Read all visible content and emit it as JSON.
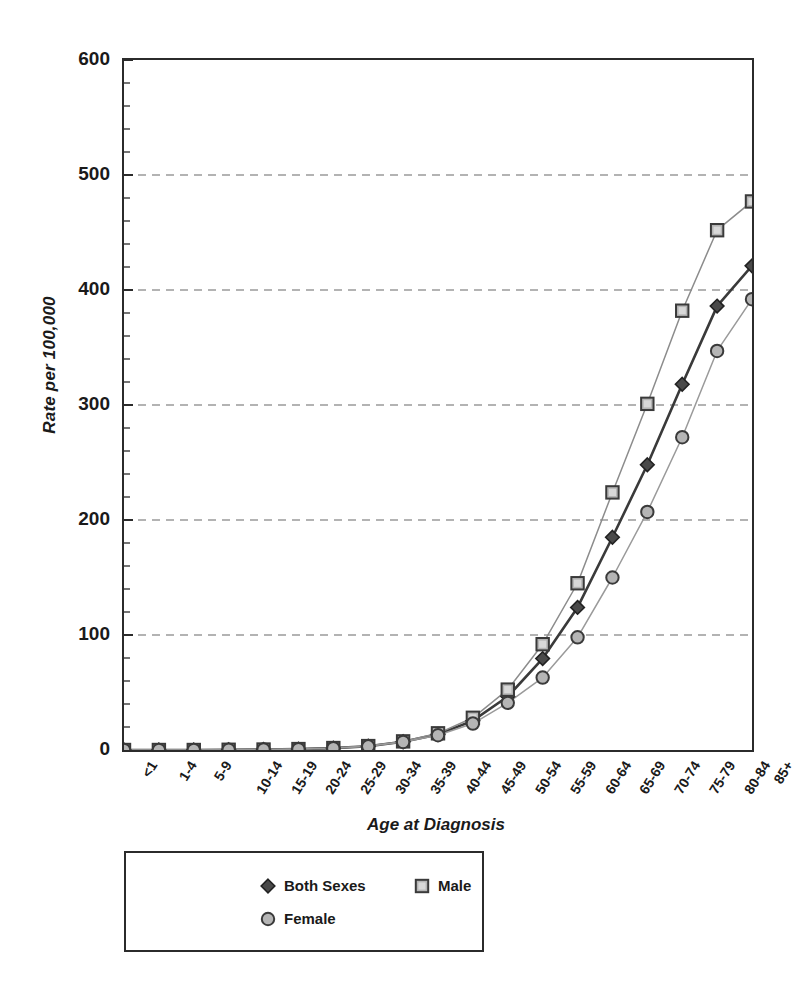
{
  "chart_data": {
    "type": "line",
    "title": "",
    "xlabel": "Age at Diagnosis",
    "ylabel": "Rate per 100,000",
    "ylim": [
      0,
      600
    ],
    "yticks": [
      0,
      100,
      200,
      300,
      400,
      500,
      600
    ],
    "grid": "horizontal-dashed",
    "legend_position": "below-plot",
    "categories": [
      "<1",
      "1-4",
      "5-9",
      "10-14",
      "15-19",
      "20-24",
      "25-29",
      "30-34",
      "35-39",
      "40-44",
      "45-49",
      "50-54",
      "55-59",
      "60-64",
      "65-69",
      "70-74",
      "75-79",
      "80-84",
      "85+"
    ],
    "series": [
      {
        "name": "Both Sexes",
        "marker": "filled-diamond",
        "color": "#3a3a3a",
        "values": [
          0,
          0,
          0,
          0.2,
          0.4,
          0.8,
          1.6,
          3.3,
          7.2,
          13.6,
          25.5,
          46.5,
          79.5,
          124.0,
          185.0,
          248.0,
          318.0,
          386.0,
          421.0
        ]
      },
      {
        "name": "Male",
        "marker": "open-square",
        "color": "#8c8c8c",
        "values": [
          0,
          0,
          0,
          0.2,
          0.4,
          0.8,
          1.7,
          3.4,
          7.5,
          14.5,
          28.0,
          52.5,
          92.0,
          145.0,
          224.0,
          301.0,
          382.0,
          452.0,
          477.0
        ]
      },
      {
        "name": "Female",
        "marker": "open-circle",
        "color": "#9a9a9a",
        "values": [
          0,
          0,
          0,
          0.2,
          0.4,
          0.8,
          1.6,
          3.2,
          7.0,
          12.8,
          23.0,
          41.0,
          63.0,
          98.0,
          150.0,
          207.0,
          272.0,
          347.0,
          392.0
        ]
      }
    ]
  },
  "axis": {
    "y_title": "Rate per 100,000",
    "x_title": "Age at Diagnosis",
    "y_tick_labels": [
      "600",
      "500",
      "400",
      "300",
      "200",
      "100",
      "0"
    ],
    "x_tick_labels": [
      "<1",
      "1-4",
      "5-9",
      "10-14",
      "15-19",
      "20-24",
      "25-29",
      "30-34",
      "35-39",
      "40-44",
      "45-49",
      "50-54",
      "55-59",
      "60-64",
      "65-69",
      "70-74",
      "75-79",
      "80-84",
      "85+"
    ]
  },
  "legend": {
    "items": [
      {
        "label": "Both Sexes",
        "marker": "filled-diamond"
      },
      {
        "label": "Male",
        "marker": "open-square"
      },
      {
        "label": "Female",
        "marker": "open-circle"
      }
    ]
  },
  "colors": {
    "axis": "#2b2b2b",
    "grid": "#9b9b9b",
    "both_sexes": "#3a3a3a",
    "male": "#8c8c8c",
    "female": "#9a9a9a",
    "marker_fill_light": "#b5b5b5",
    "marker_fill_dark": "#4a4a4a"
  }
}
